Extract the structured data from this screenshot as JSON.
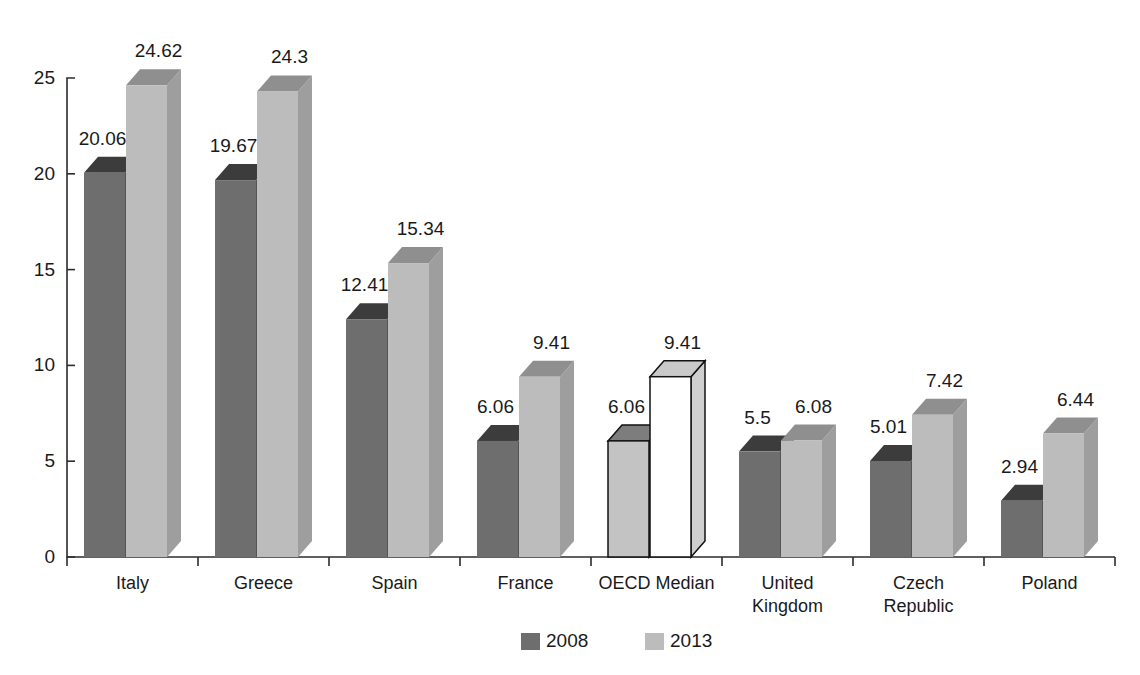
{
  "chart_data": {
    "type": "bar",
    "title": "",
    "subtitle": "",
    "xlabel": "",
    "ylabel": "",
    "ylim": [
      0,
      25
    ],
    "y_ticks": [
      0,
      5,
      10,
      15,
      20,
      25
    ],
    "grid": false,
    "legend_position": "bottom",
    "style": "3d-clustered-column",
    "categories": [
      "Italy",
      "Greece",
      "Spain",
      "France",
      "OECD Median",
      "United Kingdom",
      "Czech Republic",
      "Poland"
    ],
    "category_lines": [
      [
        "Italy"
      ],
      [
        "Greece"
      ],
      [
        "Spain"
      ],
      [
        "France"
      ],
      [
        "OECD Median"
      ],
      [
        "United",
        "Kingdom"
      ],
      [
        "Czech",
        "Republic"
      ],
      [
        "Poland"
      ]
    ],
    "series": [
      {
        "name": "2008",
        "color": "#6e6e6e",
        "values": [
          20.06,
          19.67,
          12.41,
          6.06,
          6.06,
          5.5,
          5.01,
          2.94
        ],
        "labels": [
          "20.06",
          "19.67",
          "12.41",
          "6.06",
          "6.06",
          "5.5",
          "5.01",
          "2.94"
        ]
      },
      {
        "name": "2013",
        "color": "#bcbcbc",
        "values": [
          24.62,
          24.3,
          15.34,
          9.41,
          9.41,
          6.08,
          7.42,
          6.44
        ],
        "labels": [
          "24.62",
          "24.3",
          "15.34",
          "9.41",
          "9.41",
          "6.08",
          "7.42",
          "6.44"
        ]
      }
    ],
    "highlighted_category": "OECD Median",
    "highlight_colors": {
      "series_2008": "#c3c3c3",
      "series_2013": "#ffffff",
      "outline": "#121212"
    }
  },
  "legend": {
    "entries": [
      {
        "label": "2008",
        "swatch": "#6e6e6e"
      },
      {
        "label": "2013",
        "swatch": "#bcbcbc"
      }
    ]
  },
  "axis": {
    "y_tick_labels": [
      "25",
      "20",
      "15",
      "10",
      "5",
      "0"
    ]
  },
  "palette": {
    "series_2008_front": "#6e6e6e",
    "series_2008_top": "#3c3c3c",
    "series_2008_side": "#545454",
    "series_2013_front": "#bcbcbc",
    "series_2013_top": "#8f8f8f",
    "series_2013_side": "#9e9e9e",
    "axis": "#2b2b2b",
    "text": "#1a1a1a",
    "background": "#ffffff"
  }
}
